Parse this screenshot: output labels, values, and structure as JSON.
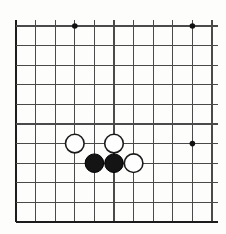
{
  "figure": {
    "kind": "go-board-diagram",
    "background_color": "#fdfdfb",
    "line_color": "#4a4a4a",
    "edge_line_color": "#1c1c1c",
    "black_stone_color": "#141414",
    "white_stone_fill": "#fefefe",
    "white_stone_outline": "#1a1a1a",
    "star_point_color": "#111111"
  },
  "chart_data": {
    "type": "table",
    "grid": {
      "columns": 11,
      "rows": 11,
      "origin_x": 16,
      "origin_y": 26,
      "spacing": 19.6,
      "overhang": 6,
      "heavy_edges": [
        "left",
        "bottom"
      ]
    },
    "star_points": [
      {
        "col": 4,
        "row": 1
      },
      {
        "col": 10,
        "row": 1
      },
      {
        "col": 10,
        "row": 7
      }
    ],
    "stones": [
      {
        "color": "white",
        "col": 4,
        "row": 7,
        "label": "white-stone-c4-r7"
      },
      {
        "color": "white",
        "col": 6,
        "row": 7,
        "label": "white-stone-c6-r7"
      },
      {
        "color": "black",
        "col": 5,
        "row": 8,
        "label": "black-stone-c5-r8"
      },
      {
        "color": "black",
        "col": 6,
        "row": 8,
        "label": "black-stone-c6-r8"
      },
      {
        "color": "white",
        "col": 7,
        "row": 8,
        "label": "white-stone-c7-r8"
      }
    ],
    "stone_radius": 9.3,
    "star_radius": 2.8
  }
}
